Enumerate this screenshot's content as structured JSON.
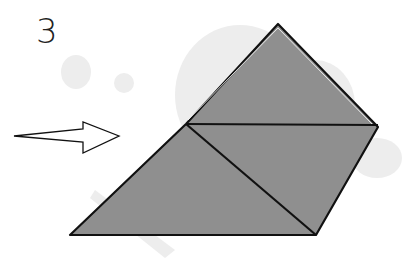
{
  "diagram": {
    "step_number": "3",
    "colors": {
      "paper_fill": "#8f8f8f",
      "outline": "#111111",
      "background_blobs": "#ececec",
      "arrow_fill": "#ffffff"
    },
    "arrow": {
      "direction": "right",
      "style": "hollow"
    },
    "shape": "folded square with horizontal crease and diagonal crease"
  }
}
